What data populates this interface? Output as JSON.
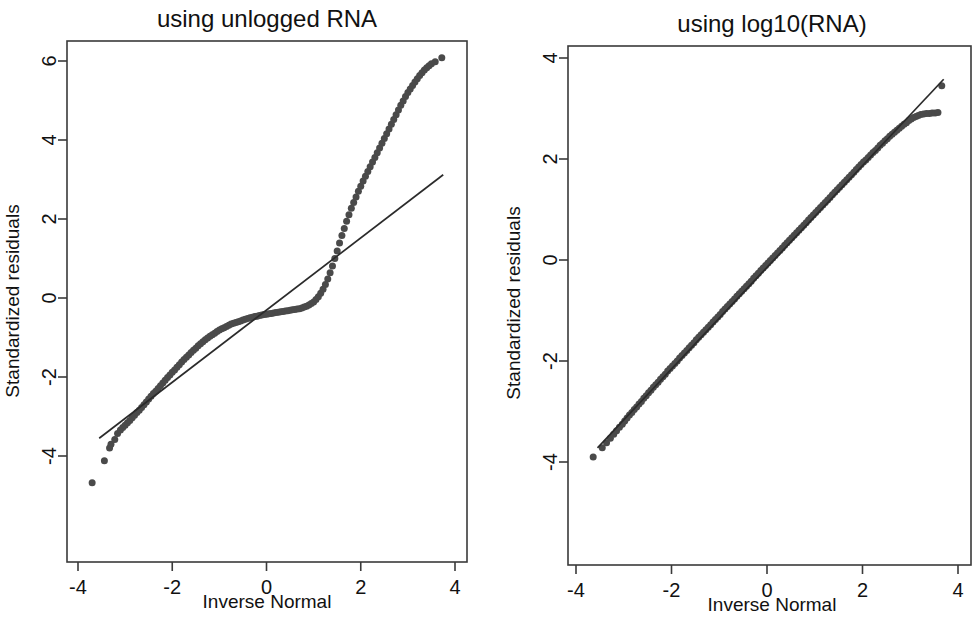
{
  "figure": {
    "background": "#ffffff",
    "point_color": "#4a4a4a",
    "line_color": "#2b2b2b",
    "axis_color": "#3a3a3a"
  },
  "chart_data": [
    {
      "type": "scatter",
      "panel": "left",
      "title": "using unlogged RNA",
      "xlabel": "Inverse Normal",
      "ylabel": "Standardized residuals",
      "xlim": [
        -4.25,
        4.25
      ],
      "ylim": [
        -4.9,
        6.45
      ],
      "xticks": [
        -4,
        -2,
        0,
        2,
        4
      ],
      "xticklabels": [
        "-4",
        "-2",
        "0",
        "2",
        "4"
      ],
      "yticks": [
        -4,
        -2,
        0,
        2,
        4,
        6
      ],
      "yticklabels": [
        "-4",
        "-2",
        "0",
        "2",
        "4",
        "6"
      ],
      "grid": false,
      "legend": null,
      "reference_line": {
        "x": [
          -3.55,
          3.75
        ],
        "y": [
          -3.55,
          3.12
        ],
        "label": "45-degree reference line"
      },
      "series": [
        {
          "name": "Standardized residuals vs inverse normal (unlogged RNA)",
          "marker": "filled-circle",
          "marker_size": 7,
          "x": [
            -3.7,
            -3.44,
            -3.33,
            -3.3,
            -3.22,
            -3.16,
            -3.1,
            -3.05,
            -3.0,
            -2.95,
            -2.9,
            -2.85,
            -2.8,
            -2.75,
            -2.7,
            -2.65,
            -2.6,
            -2.55,
            -2.5,
            -2.45,
            -2.4,
            -2.35,
            -2.3,
            -2.25,
            -2.2,
            -2.15,
            -2.1,
            -2.05,
            -2.0,
            -1.95,
            -1.9,
            -1.85,
            -1.8,
            -1.75,
            -1.7,
            -1.65,
            -1.6,
            -1.55,
            -1.5,
            -1.45,
            -1.4,
            -1.35,
            -1.3,
            -1.25,
            -1.2,
            -1.15,
            -1.1,
            -1.05,
            -1.0,
            -0.95,
            -0.9,
            -0.85,
            -0.8,
            -0.75,
            -0.7,
            -0.65,
            -0.6,
            -0.55,
            -0.5,
            -0.45,
            -0.4,
            -0.35,
            -0.3,
            -0.25,
            -0.2,
            -0.15,
            -0.1,
            -0.05,
            0.0,
            0.05,
            0.1,
            0.15,
            0.2,
            0.25,
            0.3,
            0.35,
            0.4,
            0.45,
            0.5,
            0.55,
            0.6,
            0.65,
            0.7,
            0.75,
            0.8,
            0.85,
            0.9,
            0.95,
            1.0,
            1.05,
            1.1,
            1.15,
            1.2,
            1.25,
            1.3,
            1.35,
            1.4,
            1.45,
            1.5,
            1.55,
            1.6,
            1.65,
            1.7,
            1.75,
            1.8,
            1.85,
            1.9,
            1.95,
            2.0,
            2.05,
            2.1,
            2.15,
            2.2,
            2.25,
            2.3,
            2.35,
            2.4,
            2.45,
            2.5,
            2.55,
            2.6,
            2.65,
            2.7,
            2.75,
            2.8,
            2.85,
            2.9,
            2.95,
            3.0,
            3.05,
            3.1,
            3.15,
            3.2,
            3.25,
            3.3,
            3.35,
            3.4,
            3.45,
            3.5,
            3.58,
            3.72
          ],
          "y": [
            -4.68,
            -4.12,
            -3.8,
            -3.7,
            -3.58,
            -3.43,
            -3.34,
            -3.28,
            -3.22,
            -3.16,
            -3.1,
            -3.03,
            -2.97,
            -2.9,
            -2.84,
            -2.77,
            -2.7,
            -2.63,
            -2.56,
            -2.49,
            -2.42,
            -2.36,
            -2.29,
            -2.22,
            -2.15,
            -2.08,
            -2.01,
            -1.95,
            -1.88,
            -1.82,
            -1.75,
            -1.69,
            -1.62,
            -1.56,
            -1.5,
            -1.44,
            -1.38,
            -1.32,
            -1.27,
            -1.21,
            -1.16,
            -1.11,
            -1.06,
            -1.01,
            -0.97,
            -0.93,
            -0.89,
            -0.85,
            -0.81,
            -0.78,
            -0.75,
            -0.72,
            -0.69,
            -0.66,
            -0.64,
            -0.62,
            -0.6,
            -0.58,
            -0.56,
            -0.54,
            -0.52,
            -0.5,
            -0.49,
            -0.47,
            -0.46,
            -0.44,
            -0.43,
            -0.42,
            -0.41,
            -0.4,
            -0.39,
            -0.38,
            -0.37,
            -0.36,
            -0.35,
            -0.34,
            -0.33,
            -0.32,
            -0.31,
            -0.3,
            -0.29,
            -0.28,
            -0.27,
            -0.25,
            -0.23,
            -0.21,
            -0.18,
            -0.14,
            -0.1,
            -0.04,
            0.03,
            0.12,
            0.22,
            0.34,
            0.48,
            0.64,
            0.81,
            1.0,
            1.19,
            1.39,
            1.58,
            1.76,
            1.94,
            2.11,
            2.27,
            2.42,
            2.56,
            2.7,
            2.83,
            2.96,
            3.08,
            3.2,
            3.32,
            3.44,
            3.56,
            3.68,
            3.8,
            3.92,
            4.04,
            4.16,
            4.28,
            4.4,
            4.52,
            4.64,
            4.76,
            4.88,
            4.99,
            5.1,
            5.2,
            5.29,
            5.38,
            5.47,
            5.55,
            5.63,
            5.7,
            5.77,
            5.83,
            5.88,
            5.93,
            5.98,
            6.08
          ]
        }
      ]
    },
    {
      "type": "scatter",
      "panel": "right",
      "title": "using log10(RNA)",
      "xlabel": "Inverse Normal",
      "ylabel": "Standardized residuals",
      "xlim": [
        -4.25,
        4.25
      ],
      "ylim": [
        -4.35,
        4.3
      ],
      "xticks": [
        -4,
        -2,
        0,
        2,
        4
      ],
      "xticklabels": [
        "-4",
        "-2",
        "0",
        "2",
        "4"
      ],
      "yticks": [
        -4,
        -2,
        0,
        2,
        4
      ],
      "yticklabels": [
        "-4",
        "-2",
        "0",
        "2",
        "4"
      ],
      "grid": false,
      "legend": null,
      "reference_line": {
        "x": [
          -3.55,
          3.7
        ],
        "y": [
          -3.72,
          3.58
        ],
        "label": "45-degree reference line"
      },
      "series": [
        {
          "name": "Standardized residuals vs inverse normal (log10 RNA)",
          "marker": "filled-circle",
          "marker_size": 7,
          "x": [
            -3.64,
            -3.45,
            -3.36,
            -3.28,
            -3.21,
            -3.15,
            -3.09,
            -3.03,
            -2.98,
            -2.93,
            -2.88,
            -2.83,
            -2.78,
            -2.73,
            -2.68,
            -2.63,
            -2.58,
            -2.53,
            -2.48,
            -2.43,
            -2.38,
            -2.33,
            -2.28,
            -2.23,
            -2.18,
            -2.13,
            -2.08,
            -2.03,
            -1.98,
            -1.93,
            -1.88,
            -1.83,
            -1.78,
            -1.73,
            -1.68,
            -1.63,
            -1.58,
            -1.53,
            -1.48,
            -1.43,
            -1.38,
            -1.33,
            -1.28,
            -1.23,
            -1.18,
            -1.13,
            -1.08,
            -1.03,
            -0.98,
            -0.93,
            -0.88,
            -0.83,
            -0.78,
            -0.73,
            -0.68,
            -0.63,
            -0.58,
            -0.53,
            -0.48,
            -0.43,
            -0.38,
            -0.33,
            -0.28,
            -0.23,
            -0.18,
            -0.13,
            -0.08,
            -0.03,
            0.02,
            0.07,
            0.12,
            0.17,
            0.22,
            0.27,
            0.32,
            0.37,
            0.42,
            0.47,
            0.52,
            0.57,
            0.62,
            0.67,
            0.72,
            0.77,
            0.82,
            0.87,
            0.92,
            0.97,
            1.02,
            1.07,
            1.12,
            1.17,
            1.22,
            1.27,
            1.32,
            1.37,
            1.42,
            1.47,
            1.52,
            1.57,
            1.62,
            1.67,
            1.72,
            1.77,
            1.82,
            1.87,
            1.92,
            1.97,
            2.02,
            2.07,
            2.12,
            2.17,
            2.22,
            2.27,
            2.32,
            2.37,
            2.42,
            2.47,
            2.52,
            2.57,
            2.62,
            2.67,
            2.72,
            2.77,
            2.82,
            2.87,
            2.92,
            2.97,
            3.02,
            3.07,
            3.12,
            3.17,
            3.22,
            3.28,
            3.34,
            3.4,
            3.46,
            3.52,
            3.58,
            3.66
          ],
          "y": [
            -3.9,
            -3.72,
            -3.62,
            -3.53,
            -3.45,
            -3.38,
            -3.31,
            -3.25,
            -3.19,
            -3.13,
            -3.07,
            -3.02,
            -2.96,
            -2.91,
            -2.85,
            -2.8,
            -2.74,
            -2.69,
            -2.63,
            -2.58,
            -2.52,
            -2.47,
            -2.42,
            -2.36,
            -2.31,
            -2.26,
            -2.2,
            -2.15,
            -2.1,
            -2.05,
            -2.0,
            -1.94,
            -1.89,
            -1.84,
            -1.79,
            -1.74,
            -1.69,
            -1.64,
            -1.58,
            -1.53,
            -1.48,
            -1.43,
            -1.38,
            -1.33,
            -1.28,
            -1.23,
            -1.18,
            -1.13,
            -1.08,
            -1.02,
            -0.97,
            -0.92,
            -0.87,
            -0.82,
            -0.77,
            -0.72,
            -0.67,
            -0.62,
            -0.57,
            -0.52,
            -0.47,
            -0.42,
            -0.36,
            -0.31,
            -0.26,
            -0.21,
            -0.16,
            -0.11,
            -0.06,
            -0.01,
            0.04,
            0.09,
            0.14,
            0.19,
            0.24,
            0.29,
            0.34,
            0.39,
            0.44,
            0.49,
            0.54,
            0.59,
            0.64,
            0.69,
            0.74,
            0.79,
            0.84,
            0.89,
            0.94,
            0.99,
            1.04,
            1.09,
            1.14,
            1.19,
            1.24,
            1.29,
            1.34,
            1.39,
            1.44,
            1.49,
            1.54,
            1.59,
            1.64,
            1.69,
            1.74,
            1.79,
            1.84,
            1.89,
            1.94,
            1.98,
            2.03,
            2.08,
            2.13,
            2.17,
            2.22,
            2.27,
            2.31,
            2.36,
            2.4,
            2.45,
            2.49,
            2.53,
            2.57,
            2.61,
            2.65,
            2.69,
            2.72,
            2.76,
            2.79,
            2.82,
            2.84,
            2.86,
            2.88,
            2.89,
            2.9,
            2.9,
            2.91,
            2.91,
            2.92,
            3.45
          ]
        }
      ]
    }
  ]
}
